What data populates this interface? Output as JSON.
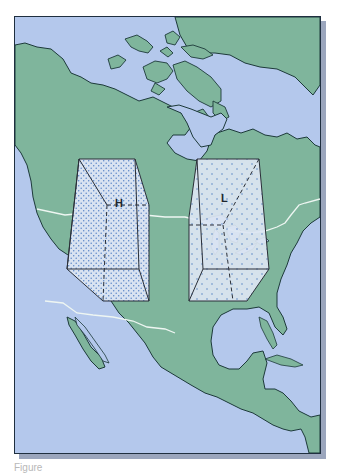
{
  "map": {
    "region": "North and Central America",
    "colors": {
      "ocean": "#b4c8ec",
      "land": "#7fb59c",
      "coastline": "#1d3a3a",
      "border": "#eef6f2",
      "box_fill": "#d9e3f1",
      "dots": "#5b86c8",
      "box_edge": "#2a2f38"
    },
    "air_masses": [
      {
        "id": "high",
        "label": "H",
        "description": "High pressure column (dense dots)",
        "location": "Western US / Canadian Rockies"
      },
      {
        "id": "low",
        "label": "L",
        "description": "Low pressure column (sparse dots)",
        "location": "Great Lakes region"
      }
    ]
  },
  "caption": {
    "text": "Figure"
  }
}
